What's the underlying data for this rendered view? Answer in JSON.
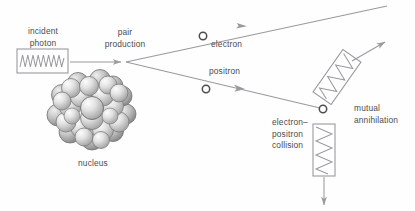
{
  "diagram": {
    "background_color": "#fefefe",
    "stroke_color": "#9a9a9e",
    "text_color": "#4c4c50",
    "labels": {
      "incident_photon": "incident\nphoton",
      "pair_production": "pair\nproduction",
      "nucleus": "nucleus",
      "electron": "electron",
      "positron": "positron",
      "electron_positron_collision": "electron–\npositron\ncollision",
      "mutual_annihilation": "mutual\nannihilation"
    },
    "elements": {
      "incident_photon_box": {
        "name": "photon-wave-box",
        "x": 17,
        "y": 49,
        "w": 51,
        "h": 24,
        "waves": 7
      },
      "incident_photon_arrow": {
        "from_x": 70,
        "from_y": 62,
        "to_x": 122,
        "to_y": 62
      },
      "pair_vertex": {
        "x": 126,
        "y": 62
      },
      "nucleus": {
        "cx": 92,
        "cy": 113,
        "r": 38,
        "sphere_count": 33
      },
      "electron_marker": {
        "x": 203,
        "y": 36,
        "r": 3.6
      },
      "positron_marker": {
        "x": 206,
        "y": 89,
        "r": 3.6
      },
      "collision_marker": {
        "x": 323,
        "y": 109,
        "r": 3.6
      },
      "electron_ray": {
        "from_x": 126,
        "from_y": 62,
        "to_x": 387,
        "to_y": 6
      },
      "positron_ray": {
        "from_x": 126,
        "from_y": 62,
        "to_x": 323,
        "to_y": 109
      },
      "annihilation_photon_box": {
        "cx": 337,
        "cy": 77,
        "w": 22,
        "h": 52,
        "rotation_deg": 35,
        "waves": 4
      },
      "annihilation_arrow": {
        "from_x": 352,
        "from_y": 60,
        "to_x": 386,
        "to_y": 41
      },
      "down_photon_box": {
        "x": 313,
        "y": 124,
        "w": 22,
        "h": 52,
        "waves": 4
      },
      "down_arrow": {
        "from_x": 324,
        "from_y": 177,
        "to_x": 324,
        "to_y": 206
      }
    }
  }
}
